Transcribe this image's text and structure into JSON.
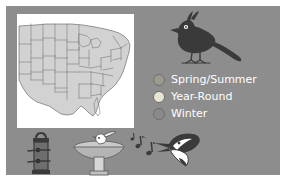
{
  "panel": {
    "background_color": "#8d8d8d",
    "outer_background_color": "#ffffff"
  },
  "map": {
    "name": "united-states-range-map",
    "panel_background": "#ffffff",
    "land_fill": "#d2d2d2",
    "border_color": "#5a5a5a",
    "description": "Range map of the eastern and central United States with state boundaries"
  },
  "bird": {
    "name": "crested-bird-silhouette",
    "body_color": "#3a3a3a",
    "eye_color": "#ffffff",
    "description": "Dark crested songbird facing left with long tail"
  },
  "legend": {
    "items": [
      {
        "label": "Spring/Summer",
        "color": "#9a9a8e",
        "icon": "circle-swatch"
      },
      {
        "label": "Year-Round",
        "color": "#e8e6d2",
        "icon": "circle-swatch"
      },
      {
        "label": "Winter",
        "color": "#8a8a8a",
        "icon": "circle-swatch"
      }
    ],
    "text_color": "#ffffff"
  },
  "bottom_icons": [
    {
      "name": "bird-feeder-icon",
      "label": "Bird feeder"
    },
    {
      "name": "birdbath-icon",
      "label": "Birdbath"
    },
    {
      "name": "bird-song-icon",
      "label": "Bird song"
    }
  ]
}
